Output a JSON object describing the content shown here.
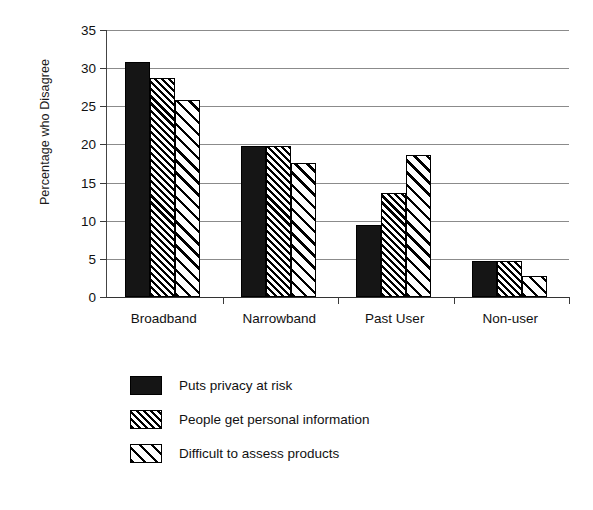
{
  "chart_data": {
    "type": "bar",
    "title": "",
    "xlabel": "",
    "ylabel": "Percentage who Disagree",
    "ylim": [
      0,
      35
    ],
    "ytick_step": 5,
    "yticks": [
      35,
      30,
      25,
      20,
      15,
      10,
      5,
      0
    ],
    "grid": true,
    "legend_position": "bottom",
    "categories": [
      "Broadband",
      "Narrowband",
      "Past User",
      "Non-user"
    ],
    "series": [
      {
        "name": "Puts privacy at risk",
        "pattern": "solid-black",
        "values": [
          30.8,
          19.8,
          9.5,
          4.7
        ]
      },
      {
        "name": "People get personal information",
        "pattern": "dense-diagonal-hatch",
        "values": [
          28.7,
          19.8,
          13.7,
          4.7
        ]
      },
      {
        "name": "Difficult to assess products",
        "pattern": "wide-diagonal-hatch",
        "values": [
          25.8,
          17.6,
          18.6,
          2.8
        ]
      }
    ]
  },
  "colors": {
    "series_1": "#151515",
    "series_2": "#000000",
    "series_3": "#000000",
    "axis": "#333333",
    "gridline": "#8b8b8b",
    "background": "#ffffff"
  }
}
